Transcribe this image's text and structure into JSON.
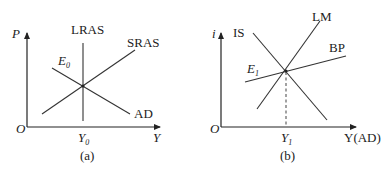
{
  "diagram_a": {
    "caption": "(a)",
    "y_axis_label": "P",
    "x_axis_label": "Y",
    "origin_label": "O",
    "equilibrium_label": "E",
    "equilibrium_sub": "0",
    "output_label": "Y",
    "output_sub": "0",
    "curves": {
      "lras": "LRAS",
      "sras": "SRAS",
      "ad": "AD"
    }
  },
  "diagram_b": {
    "caption": "(b)",
    "y_axis_label": "i",
    "x_axis_label": "Y(AD)",
    "origin_label": "O",
    "equilibrium_label": "E",
    "equilibrium_sub": "1",
    "output_label": "Y",
    "output_sub": "1",
    "curves": {
      "is": "IS",
      "lm": "LM",
      "bp": "BP"
    }
  },
  "colors": {
    "line": "#333333",
    "text": "#222222",
    "background": "#ffffff"
  }
}
